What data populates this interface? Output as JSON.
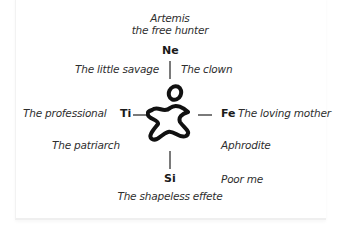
{
  "diagram": {
    "center_icon": "running-figure-icon",
    "top": {
      "title_line1": "Artemis",
      "title_line2": "the free hunter",
      "function": "Ne"
    },
    "upper_left": "The little savage",
    "upper_right": "The clown",
    "left": {
      "label": "The professional",
      "function": "Ti"
    },
    "right": {
      "function": "Fe",
      "label": "The loving mother"
    },
    "lower_left": "The patriarch",
    "lower_right": "Aphrodite",
    "bottom": {
      "function": "Si",
      "label": "The shapeless effete"
    },
    "bottom_right": "Poor me"
  }
}
